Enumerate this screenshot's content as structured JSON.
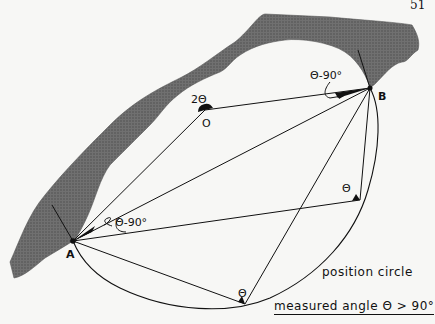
{
  "page_number": "51",
  "figure": {
    "points": {
      "A": {
        "label": "A",
        "x": 73,
        "y": 241
      },
      "B": {
        "label": "B",
        "x": 370,
        "y": 88
      },
      "O": {
        "label": "O",
        "x": 205,
        "y": 110
      }
    },
    "angle_labels": {
      "center": "2Θ",
      "at_B": "Θ-90°",
      "at_A": "Θ-90°",
      "right_point": "Θ",
      "bottom_point": "Θ"
    },
    "circle_label": "position circle",
    "caption": "measured angle Θ > 90°",
    "colors": {
      "land": "#6a6a6a",
      "ink": "#111111",
      "paper": "#f7f7f5"
    }
  }
}
